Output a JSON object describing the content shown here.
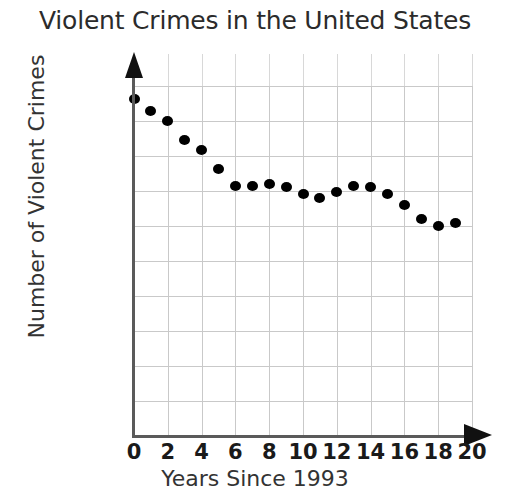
{
  "chart_data": {
    "type": "scatter",
    "title": "Violent Crimes in the United States",
    "xlabel": "Years Since 1993",
    "ylabel": "Number of Violent Crimes",
    "xlim": [
      0,
      20
    ],
    "ylim": [
      0,
      2000000
    ],
    "grid": true,
    "legend": null,
    "x_tick_labels": [
      "0",
      "2",
      "4",
      "6",
      "8",
      "10",
      "12",
      "14",
      "16",
      "18",
      "20"
    ],
    "x_ticks": [
      0,
      2,
      4,
      6,
      8,
      10,
      12,
      14,
      16,
      18,
      20
    ],
    "y_tick_labels": [
      "0",
      "200000",
      "400000",
      "600000",
      "800000",
      "1000000",
      "1200000",
      "1400000",
      "1600000",
      "1800000",
      "2000000"
    ],
    "y_ticks": [
      0,
      200000,
      400000,
      600000,
      800000,
      1000000,
      1200000,
      1400000,
      1600000,
      1800000,
      2000000
    ],
    "marker": "filled-circle",
    "marker_color": "#000000",
    "grid_color": "#c9c9c9",
    "axis_color": "#5a5a5a",
    "x": [
      0,
      1,
      2,
      3,
      4,
      5,
      6,
      7,
      8,
      9,
      10,
      11,
      12,
      13,
      14,
      15,
      16,
      17,
      18,
      19
    ],
    "values": [
      1925000,
      1860000,
      1800000,
      1690000,
      1635000,
      1525000,
      1430000,
      1430000,
      1440000,
      1425000,
      1385000,
      1360000,
      1395000,
      1430000,
      1425000,
      1385000,
      1320000,
      1240000,
      1200000,
      1215000
    ]
  }
}
